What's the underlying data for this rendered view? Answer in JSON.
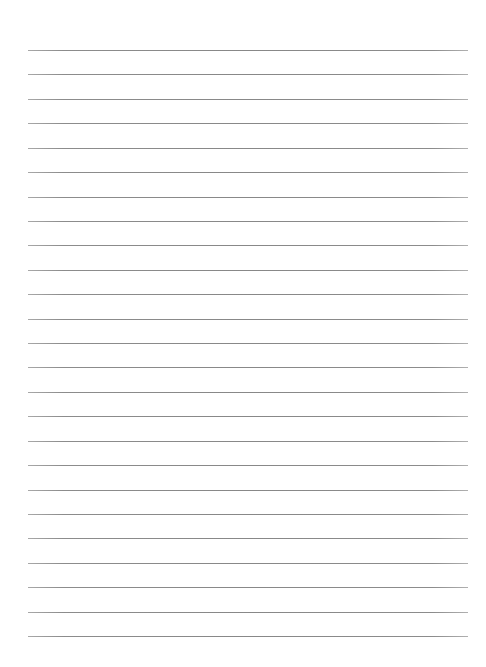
{
  "page": {
    "type": "lined-paper",
    "background_color": "#ffffff",
    "line_color": "#8a8a8a",
    "line_count": 25,
    "first_line_y": 50,
    "line_spacing": 24.42,
    "line_left_x": 28,
    "line_right_x": 468
  }
}
